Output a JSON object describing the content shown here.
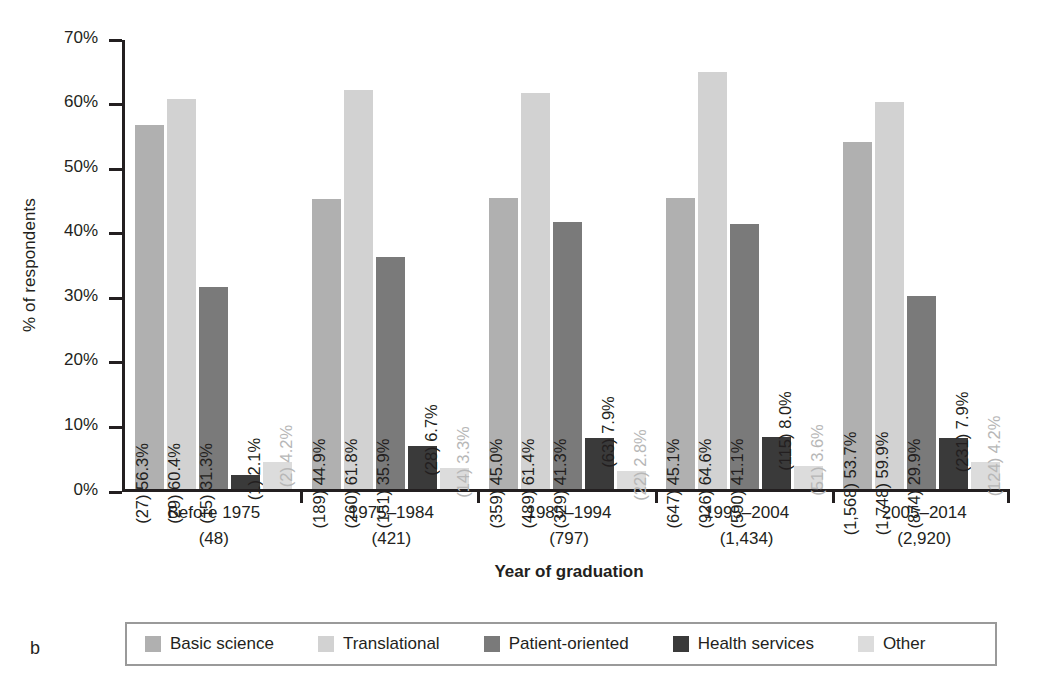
{
  "panel": {
    "label": "b"
  },
  "chart_data": {
    "type": "bar",
    "title": "",
    "xlabel": "Year of graduation",
    "ylabel": "% of respondents",
    "ylim": [
      0,
      70
    ],
    "ytick_labels": [
      "0%",
      "10%",
      "20%",
      "30%",
      "40%",
      "50%",
      "60%",
      "70%"
    ],
    "ytick_values": [
      0,
      10,
      20,
      30,
      40,
      50,
      60,
      70
    ],
    "grid": false,
    "legend_position": "bottom",
    "categories": [
      "Before 1975",
      "1975–1984",
      "1985–1994",
      "1995–2004",
      "2005–2014"
    ],
    "category_counts": [
      "(48)",
      "(421)",
      "(797)",
      "(1,434)",
      "(2,920)"
    ],
    "series": [
      {
        "name": "Basic science",
        "color": "#b0b0b0",
        "values": [
          56.3,
          44.9,
          45.0,
          45.1,
          53.7
        ],
        "counts": [
          27,
          189,
          359,
          647,
          1568
        ],
        "labels": [
          "(27) 56.3%",
          "(189) 44.9%",
          "(359) 45.0%",
          "(647) 45.1%",
          "(1,568) 53.7%"
        ]
      },
      {
        "name": "Translational",
        "color": "#d2d2d2",
        "values": [
          60.4,
          61.8,
          61.4,
          64.6,
          59.9
        ],
        "counts": [
          29,
          260,
          489,
          926,
          1748
        ],
        "labels": [
          "(29) 60.4%",
          "(260) 61.8%",
          "(489) 61.4%",
          "(926) 64.6%",
          "(1,748) 59.9%"
        ]
      },
      {
        "name": "Patient-oriented",
        "color": "#7a7a7a",
        "values": [
          31.3,
          35.9,
          41.3,
          41.1,
          29.9
        ],
        "counts": [
          15,
          151,
          329,
          590,
          874
        ],
        "labels": [
          "(15) 31.3%",
          "(151) 35.9%",
          "(329) 41.3%",
          "(590) 41.1%",
          "(874) 29.9%"
        ]
      },
      {
        "name": "Health services",
        "color": "#3a3a3a",
        "values": [
          2.1,
          6.7,
          7.9,
          8.0,
          7.9
        ],
        "counts": [
          1,
          28,
          63,
          115,
          231
        ],
        "labels": [
          "(1) 2.1%",
          "(28) 6.7%",
          "(63) 7.9%",
          "(115) 8.0%",
          "(231) 7.9%"
        ]
      },
      {
        "name": "Other",
        "color": "#dcdcdc",
        "values": [
          4.2,
          3.3,
          2.8,
          3.6,
          4.2
        ],
        "counts": [
          2,
          14,
          22,
          51,
          124
        ],
        "labels": [
          "(2) 4.2%",
          "(14) 3.3%",
          "(22) 2.8%",
          "(51) 3.6%",
          "(124) 4.2%"
        ]
      }
    ]
  }
}
